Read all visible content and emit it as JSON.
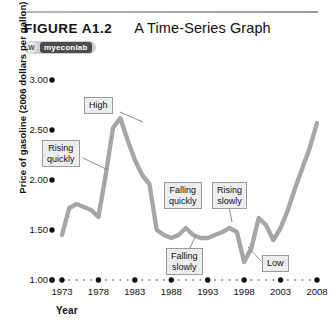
{
  "figure": {
    "label": "FIGURE A1.2",
    "title": "A Time-Series Graph",
    "badge_logo": "W",
    "badge_text": "myeconlab"
  },
  "chart_data": {
    "type": "line",
    "title": "A Time-Series Graph",
    "xlabel": "Year",
    "ylabel": "Price of gasoline (2006 dollars per gallon)",
    "xlim": [
      1973,
      2008
    ],
    "ylim": [
      1.0,
      3.0
    ],
    "xticks": [
      "1973",
      "1978",
      "1983",
      "1988",
      "1993",
      "1998",
      "2003",
      "2008"
    ],
    "yticks": [
      "1.00",
      "1.50",
      "2.00",
      "2.50",
      "3.00"
    ],
    "grid": false,
    "legend": "none",
    "series": [
      {
        "name": "Price of gasoline",
        "x": [
          1973,
          1974,
          1975,
          1976,
          1977,
          1978,
          1979,
          1980,
          1981,
          1982,
          1983,
          1984,
          1985,
          1986,
          1987,
          1988,
          1989,
          1990,
          1991,
          1992,
          1993,
          1994,
          1995,
          1996,
          1997,
          1998,
          1999,
          2000,
          2001,
          2002,
          2003,
          2004,
          2005,
          2006,
          2007,
          2008
        ],
        "values": [
          1.45,
          1.72,
          1.76,
          1.73,
          1.7,
          1.63,
          2.05,
          2.52,
          2.62,
          2.4,
          2.2,
          2.05,
          1.96,
          1.5,
          1.45,
          1.42,
          1.45,
          1.52,
          1.45,
          1.42,
          1.42,
          1.45,
          1.48,
          1.52,
          1.48,
          1.18,
          1.32,
          1.62,
          1.55,
          1.4,
          1.52,
          1.7,
          1.92,
          2.12,
          2.32,
          2.57
        ]
      }
    ],
    "annotations": [
      {
        "text": "High",
        "x": 1981,
        "y": 2.62
      },
      {
        "text": "Rising\nquickly",
        "x": 1978,
        "y": 2.05
      },
      {
        "text": "Falling\nquickly",
        "x": 1986,
        "y": 1.85
      },
      {
        "text": "Rising\nslowly",
        "x": 1994,
        "y": 1.85
      },
      {
        "text": "Falling\nslowly",
        "x": 1990,
        "y": 1.2
      },
      {
        "text": "Low",
        "x": 1999,
        "y": 1.18
      }
    ]
  }
}
